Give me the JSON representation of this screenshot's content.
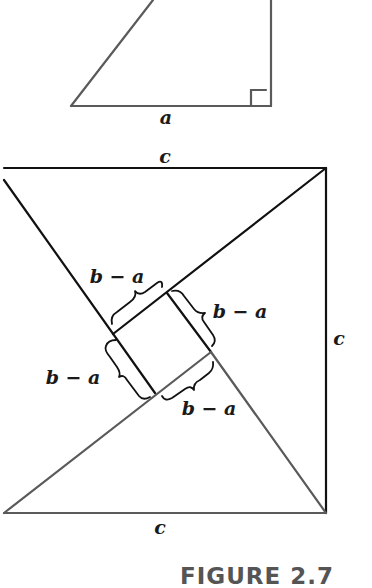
{
  "figure": {
    "caption": "FIGURE 2.7",
    "triangle": {
      "base_label": "a",
      "has_right_angle_marker": true
    },
    "square": {
      "top_label": "c",
      "right_label": "c",
      "bottom_label": "c",
      "inner_labels": [
        "b − a",
        "b − a",
        "b − a",
        "b − a"
      ]
    },
    "colors": {
      "line": "#111111",
      "line_light": "#5a5a5a",
      "caption": "#555555"
    }
  }
}
